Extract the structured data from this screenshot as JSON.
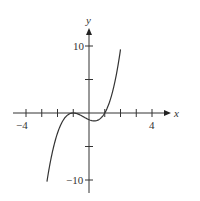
{
  "chart_data": {
    "type": "line",
    "title": "",
    "xlabel": "x",
    "ylabel": "y",
    "xlim": [
      -4.8,
      5.2
    ],
    "ylim": [
      -12,
      12.7
    ],
    "grid": false,
    "x_ticks": [
      -4,
      -3,
      -2,
      -1,
      1,
      2,
      3,
      4
    ],
    "x_tick_labels": {
      "-4": "−4",
      "4": "4"
    },
    "y_ticks": [
      -10,
      -5,
      5,
      10
    ],
    "y_tick_labels": {
      "-10": "−10",
      "10": "10"
    },
    "series": [
      {
        "name": "f(x)",
        "description": "cubic curve with local max touching x-axis near x=-1, local min near x=0.33, zero at x=1",
        "x": [
          -2.67,
          -2.5,
          -2.0,
          -1.5,
          -1.0,
          -0.5,
          0.0,
          0.33,
          0.5,
          1.0,
          1.5,
          2.0
        ],
        "y": [
          -10.2,
          -7.9,
          -3.0,
          -0.6,
          0.0,
          -0.6,
          -1.0,
          -1.2,
          -1.1,
          0.0,
          3.1,
          9.5
        ]
      }
    ]
  },
  "labels": {
    "x_axis": "x",
    "y_axis": "y",
    "x_min_label": "−4",
    "x_max_label": "4",
    "y_max_label": "10",
    "y_min_label": "−10"
  },
  "colors": {
    "axis": "#333333",
    "curve": "#333333"
  }
}
